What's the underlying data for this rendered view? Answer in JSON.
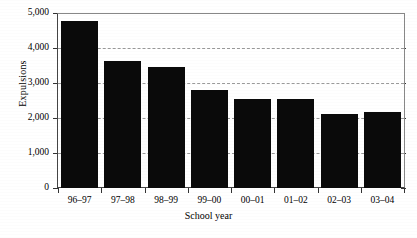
{
  "chart_data": {
    "type": "bar",
    "title": "",
    "subtitle": "",
    "xlabel": "School year",
    "ylabel": "Expulsions",
    "categories": [
      "96–97",
      "97–98",
      "98–99",
      "99–00",
      "00–01",
      "01–02",
      "02–03",
      "03–04"
    ],
    "values": [
      4800,
      3660,
      3490,
      2830,
      2550,
      2560,
      2140,
      2170
    ],
    "series": [
      {
        "name": "Expulsions",
        "values": [
          4800,
          3660,
          3490,
          2830,
          2550,
          2560,
          2140,
          2170
        ],
        "color": "#0a0a0a"
      }
    ],
    "ylim": [
      0,
      5000
    ],
    "ytick_values": [
      0,
      1000,
      2000,
      3000,
      4000,
      5000
    ],
    "ytick_labels": [
      "0",
      "1,000",
      "2,000",
      "3,000",
      "4,000",
      "5,000"
    ],
    "gridlines": {
      "horizontal": true,
      "vertical": false,
      "style": "dashed",
      "color": "#9a9a9a",
      "at_values": [
        1000,
        2000,
        3000,
        4000
      ]
    },
    "legend": {
      "visible": false,
      "position": "none",
      "entries": []
    },
    "annotations": [],
    "bar_color": "#0a0a0a",
    "background_color": "#ffffff",
    "axis_color": "#333333"
  }
}
